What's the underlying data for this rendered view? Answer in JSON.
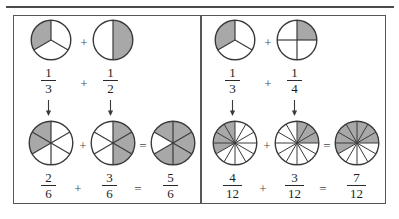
{
  "figure": {
    "title_rule": "horizontal-rule",
    "colors": {
      "shade": "#a8a8a8",
      "outline": "#3a3a3a",
      "frame": "#55565a",
      "text": "#1e1e1e",
      "operator": "#4b4b4b"
    }
  },
  "panels": [
    {
      "id": "left",
      "name": "one-third-plus-one-half",
      "top_row": {
        "terms": [
          {
            "numerator": "1",
            "denominator": "3",
            "slices": 3,
            "shaded": 1,
            "start_angle": -90,
            "shaded_indices": [
              2
            ]
          },
          {
            "numerator": "1",
            "denominator": "2",
            "slices": 2,
            "shaded": 1,
            "start_angle": -90,
            "shaded_indices": [
              0
            ]
          }
        ],
        "operator": "+"
      },
      "arrows": [
        "↓",
        "↓"
      ],
      "bottom_row": {
        "terms": [
          {
            "numerator": "2",
            "denominator": "6",
            "slices": 6,
            "shaded": 2,
            "start_angle": -90,
            "shaded_indices": [
              4,
              5
            ]
          },
          {
            "numerator": "3",
            "denominator": "6",
            "slices": 6,
            "shaded": 3,
            "start_angle": -90,
            "shaded_indices": [
              0,
              1,
              2
            ]
          }
        ],
        "result": {
          "numerator": "5",
          "denominator": "6",
          "slices": 6,
          "shaded": 5,
          "start_angle": -90,
          "shaded_indices": [
            0,
            1,
            2,
            3,
            5
          ]
        },
        "operator": "+",
        "equals": "="
      }
    },
    {
      "id": "right",
      "name": "one-third-plus-one-fourth",
      "top_row": {
        "terms": [
          {
            "numerator": "1",
            "denominator": "3",
            "slices": 3,
            "shaded": 1,
            "start_angle": -90,
            "shaded_indices": [
              2
            ]
          },
          {
            "numerator": "1",
            "denominator": "4",
            "slices": 4,
            "shaded": 1,
            "start_angle": -90,
            "shaded_indices": [
              0
            ]
          }
        ],
        "operator": "+"
      },
      "arrows": [
        "↓",
        "↓"
      ],
      "bottom_row": {
        "terms": [
          {
            "numerator": "4",
            "denominator": "12",
            "slices": 12,
            "shaded": 4,
            "start_angle": -90,
            "shaded_indices": [
              8,
              9,
              10,
              11
            ]
          },
          {
            "numerator": "3",
            "denominator": "12",
            "slices": 12,
            "shaded": 3,
            "start_angle": -90,
            "shaded_indices": [
              0,
              1,
              2
            ]
          }
        ],
        "result": {
          "numerator": "7",
          "denominator": "12",
          "slices": 12,
          "shaded": 7,
          "start_angle": -90,
          "shaded_indices": [
            0,
            1,
            2,
            9,
            10,
            11,
            8
          ]
        },
        "operator": "+",
        "equals": "="
      }
    }
  ],
  "layout": {
    "panel_left_x": 13,
    "panel_right_x": 201,
    "frame_top": 15
  }
}
